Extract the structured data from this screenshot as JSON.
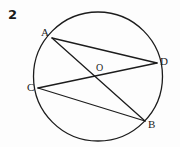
{
  "figure": {
    "problem_number": "2",
    "background_color": "#fdfdfd",
    "stroke_color": "#1c1c1c",
    "label_color": "#1c1c1c"
  },
  "circle": {
    "center_x": 98,
    "center_y": 76.5,
    "radius": 64.5,
    "stroke_width": 1.3
  },
  "points": [
    {
      "name": "A",
      "x": 52,
      "y": 38,
      "label": "A",
      "label_x": 41,
      "label_y": 27
    },
    {
      "name": "D",
      "x": 157,
      "y": 63,
      "label": "D",
      "label_x": 160,
      "label_y": 56
    },
    {
      "name": "C",
      "x": 38,
      "y": 88,
      "label": "C",
      "label_x": 27,
      "label_y": 82
    },
    {
      "name": "B",
      "x": 145,
      "y": 121,
      "label": "B",
      "label_x": 148,
      "label_y": 119
    },
    {
      "name": "O",
      "x": 98,
      "y": 76.5,
      "label": "O",
      "label_x": 96,
      "label_y": 62
    }
  ],
  "chords": [
    {
      "name": "chord-AD",
      "from": "A",
      "to": "D",
      "x1": 52,
      "y1": 38,
      "x2": 157,
      "y2": 63
    },
    {
      "name": "chord-AB",
      "from": "A",
      "to": "B",
      "x1": 52,
      "y1": 38,
      "x2": 145,
      "y2": 121
    },
    {
      "name": "chord-CD",
      "from": "C",
      "to": "D",
      "x1": 38,
      "y1": 88,
      "x2": 157,
      "y2": 63
    },
    {
      "name": "chord-CB",
      "from": "C",
      "to": "B",
      "x1": 38,
      "y1": 88,
      "x2": 145,
      "y2": 121
    }
  ]
}
